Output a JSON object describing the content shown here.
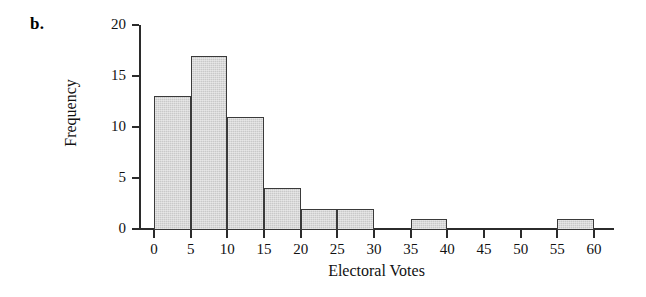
{
  "figure": {
    "panel_label": "b."
  },
  "chart_data": {
    "type": "bar",
    "title": "",
    "subtitle": "",
    "xlabel": "Electoral Votes",
    "ylabel": "Frequency",
    "xlim": [
      0,
      60
    ],
    "ylim": [
      0,
      20
    ],
    "xticks": [
      0,
      5,
      10,
      15,
      20,
      25,
      30,
      35,
      40,
      45,
      50,
      55,
      60
    ],
    "yticks": [
      0,
      5,
      10,
      15,
      20
    ],
    "xtick_labels": [
      "0",
      "5",
      "10",
      "15",
      "20",
      "25",
      "30",
      "35",
      "40",
      "45",
      "50",
      "55",
      "60"
    ],
    "ytick_labels": [
      "0",
      "5",
      "10",
      "15",
      "20"
    ],
    "grid": false,
    "legend": null,
    "bin_width": 5,
    "categories": [
      "0-5",
      "5-10",
      "10-15",
      "15-20",
      "20-25",
      "25-30",
      "30-35",
      "35-40",
      "40-45",
      "45-50",
      "50-55",
      "55-60"
    ],
    "bin_edges": [
      0,
      5,
      10,
      15,
      20,
      25,
      30,
      35,
      40,
      45,
      50,
      55,
      60
    ],
    "values": [
      13,
      17,
      11,
      4,
      2,
      2,
      0,
      1,
      0,
      0,
      0,
      1
    ],
    "bars": [
      {
        "label": "0-5",
        "x0": 0,
        "x1": 5,
        "value": 13
      },
      {
        "label": "5-10",
        "x0": 5,
        "x1": 10,
        "value": 17
      },
      {
        "label": "10-15",
        "x0": 10,
        "x1": 15,
        "value": 11
      },
      {
        "label": "15-20",
        "x0": 15,
        "x1": 20,
        "value": 4
      },
      {
        "label": "20-25",
        "x0": 20,
        "x1": 25,
        "value": 2
      },
      {
        "label": "25-30",
        "x0": 25,
        "x1": 30,
        "value": 2
      },
      {
        "label": "30-35",
        "x0": 30,
        "x1": 35,
        "value": 0
      },
      {
        "label": "35-40",
        "x0": 35,
        "x1": 40,
        "value": 1
      },
      {
        "label": "40-45",
        "x0": 40,
        "x1": 45,
        "value": 0
      },
      {
        "label": "45-50",
        "x0": 45,
        "x1": 50,
        "value": 0
      },
      {
        "label": "50-55",
        "x0": 50,
        "x1": 55,
        "value": 0
      },
      {
        "label": "55-60",
        "x0": 55,
        "x1": 60,
        "value": 1
      }
    ],
    "colors": {
      "bar_fill": "#c9c9c9",
      "bar_edge": "#3a3a3a",
      "axis": "#2b2b2b",
      "text": "#111111",
      "background": "#ffffff"
    }
  }
}
